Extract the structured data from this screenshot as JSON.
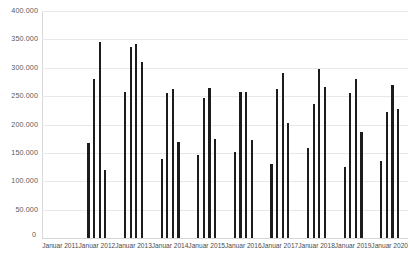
{
  "chart_data": {
    "type": "bar",
    "title": "",
    "subtitle": "",
    "xlabel": "",
    "ylabel": "",
    "ylim": [
      0,
      400000
    ],
    "y_ticks": [
      0,
      50000,
      100000,
      150000,
      200000,
      250000,
      300000,
      350000,
      400000
    ],
    "y_tick_labels": [
      "0",
      "50.000",
      "100.000",
      "150.000",
      "200.000",
      "250.000",
      "300.000",
      "350.000",
      "400.000"
    ],
    "grid": true,
    "legend": false,
    "legend_position": "none",
    "bar_color": "#1c1c1c",
    "grid_color": "#e8e8e8",
    "categories": [
      "Januar 2011",
      "Januar 2012",
      "Januar 2013",
      "Januar 2014",
      "Januar 2015",
      "Januar 2016",
      "Januar 2017",
      "Januar 2018",
      "Januar 2019",
      "Januar 2020"
    ],
    "groups": [
      {
        "label": "Januar 2011",
        "values": []
      },
      {
        "label": "Januar 2012",
        "values": [
          168000,
          280000,
          346000,
          119000
        ]
      },
      {
        "label": "Januar 2013",
        "values": [
          258000,
          337000,
          342000,
          311000
        ]
      },
      {
        "label": "Januar 2014",
        "values": [
          139000,
          255000,
          262000,
          169000
        ]
      },
      {
        "label": "Januar 2015",
        "values": [
          147000,
          246000,
          265000,
          174000
        ]
      },
      {
        "label": "Januar 2016",
        "values": [
          152000,
          258000,
          258000,
          172000
        ]
      },
      {
        "label": "Januar 2017",
        "values": [
          131000,
          262000,
          290000,
          203000
        ]
      },
      {
        "label": "Januar 2018",
        "values": [
          159000,
          236000,
          298000,
          266000
        ]
      },
      {
        "label": "Januar 2019",
        "values": [
          126000,
          255000,
          281000,
          186000
        ]
      },
      {
        "label": "Januar 2020",
        "values": [
          135000,
          222000,
          270000,
          228000
        ]
      }
    ],
    "bars_per_group": 4
  }
}
